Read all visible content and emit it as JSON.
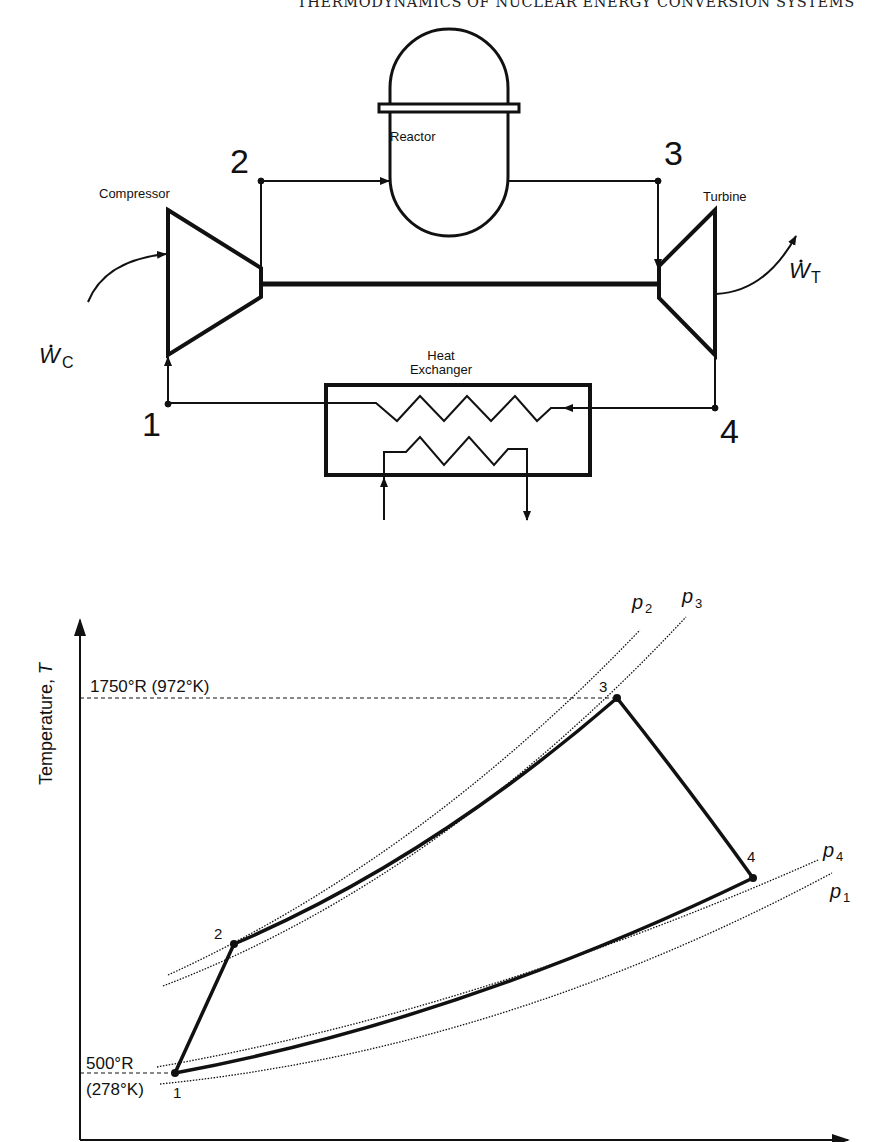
{
  "header": {
    "running_title": "THERMODYNAMICS OF NUCLEAR ENERGY CONVERSION SYSTEMS"
  },
  "schematic": {
    "components": {
      "reactor": "Reactor",
      "compressor": "Compressor",
      "turbine": "Turbine",
      "heat_exchanger_line1": "Heat",
      "heat_exchanger_line2": "Exchanger"
    },
    "state_points": [
      "1",
      "2",
      "3",
      "4"
    ],
    "work_labels": {
      "compressor_work": {
        "symbol": "W",
        "subscript": "C"
      },
      "turbine_work": {
        "symbol": "W",
        "subscript": "T"
      }
    }
  },
  "ts_diagram": {
    "y_axis_label": "Temperature, T",
    "y_axis_label_prefix": "Temperature, ",
    "y_axis_label_var": "T",
    "t_high_label": "1750°R (972°K)",
    "t_low_label_line1": "500°R",
    "t_low_label_line2": "(278°K)",
    "points": [
      "1",
      "2",
      "3",
      "4"
    ],
    "isobars": [
      {
        "symbol": "p",
        "subscript": "2"
      },
      {
        "symbol": "p",
        "subscript": "3"
      },
      {
        "symbol": "p",
        "subscript": "4"
      },
      {
        "symbol": "p",
        "subscript": "1"
      }
    ]
  }
}
